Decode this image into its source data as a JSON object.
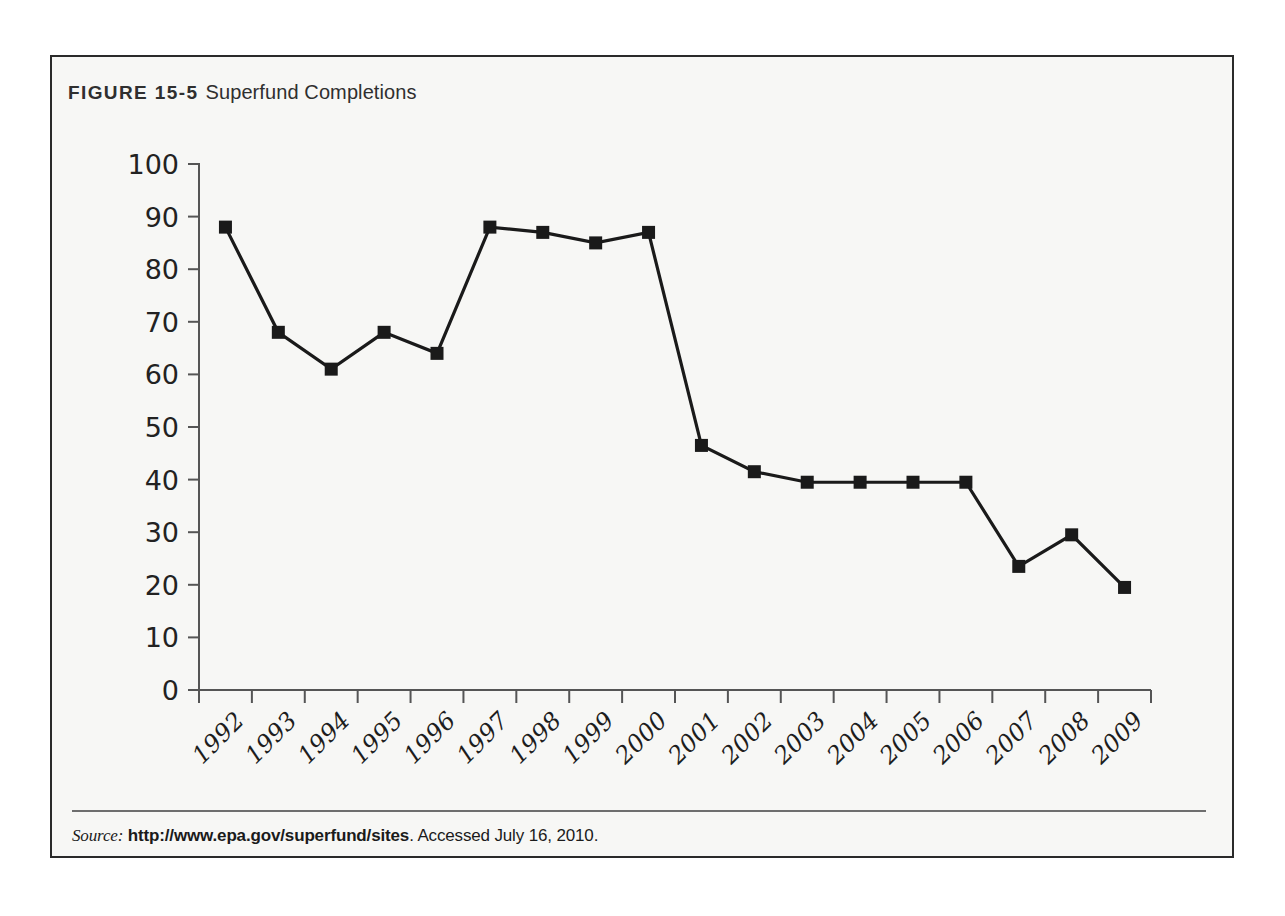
{
  "figure": {
    "label": "FIGURE 15-5",
    "title": "Superfund Completions"
  },
  "source": {
    "prefix": "Source:",
    "url": "http://www.epa.gov/superfund/sites",
    "accessed": ". Accessed July 16, 2010."
  },
  "colors": {
    "frame_border": "#2a2a2a",
    "frame_background": "#f7f7f5",
    "line": "#1a1a1a",
    "marker": "#1a1a1a",
    "axis": "#555555",
    "divider": "#6e6e6e",
    "text": "#222222"
  },
  "chart_data": {
    "type": "line",
    "title": "Superfund Completions",
    "xlabel": "",
    "ylabel": "",
    "ylim": [
      0,
      100
    ],
    "ytick_step": 10,
    "yticks": [
      0,
      10,
      20,
      30,
      40,
      50,
      60,
      70,
      80,
      90,
      100
    ],
    "grid": false,
    "legend": false,
    "marker": "square",
    "xtick_rotation_deg": -45,
    "categories": [
      "1992",
      "1993",
      "1994",
      "1995",
      "1996",
      "1997",
      "1997b",
      "1999",
      "2000",
      "2001",
      "2002",
      "2003",
      "2004",
      "2005",
      "2006",
      "2007",
      "2008",
      "2009"
    ],
    "x": [
      "1992",
      "1993",
      "1994",
      "1995",
      "1996",
      "1997",
      "1998",
      "1999",
      "2000",
      "2001",
      "2002",
      "2003",
      "2004",
      "2005",
      "2006",
      "2007",
      "2008",
      "2009"
    ],
    "values": [
      88,
      68,
      61,
      68,
      64,
      88,
      87,
      85,
      87,
      46.5,
      41.5,
      39.5,
      39.5,
      39.5,
      39.5,
      23.5,
      29.5,
      19.5
    ],
    "series": [
      {
        "name": "Superfund Completions",
        "values": [
          88,
          68,
          61,
          68,
          64,
          88,
          87,
          85,
          87,
          46.5,
          41.5,
          39.5,
          39.5,
          39.5,
          39.5,
          23.5,
          29.5,
          19.5
        ]
      }
    ]
  }
}
